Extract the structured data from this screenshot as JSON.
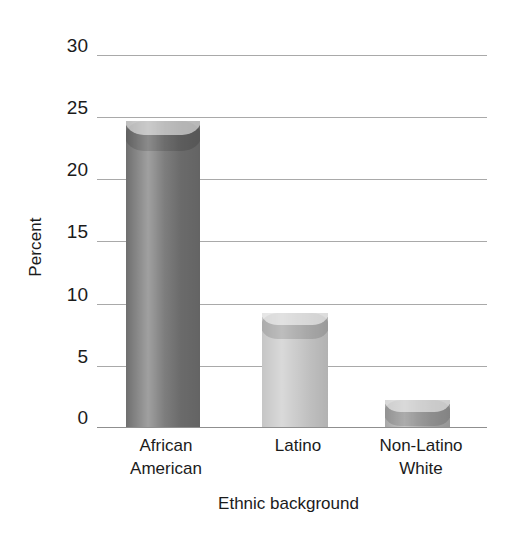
{
  "chart_data": {
    "type": "bar",
    "title": "",
    "subtitle": "",
    "xlabel": "Ethnic background",
    "ylabel": "Percent",
    "categories": [
      "African\nAmerican",
      "Latino",
      "Non-Latino\nWhite"
    ],
    "category_labels_flat": [
      "African American",
      "Latino",
      "Non-Latino White"
    ],
    "values": [
      24.7,
      9.2,
      2.2
    ],
    "ylim": [
      0,
      30
    ],
    "yticks": [
      0,
      5,
      10,
      15,
      20,
      25,
      30
    ],
    "ytick_labels": [
      "0",
      "5",
      "10",
      "15",
      "20",
      "25",
      "30"
    ],
    "grid": "horizontal",
    "legend": "none",
    "bar_style": "3d-cylinder",
    "bar_colors": [
      "#6f6f6f",
      "#c6c6c6",
      "#a8a8a8"
    ],
    "gridline_color": "#a9a9a9",
    "background_color": "#ffffff",
    "text_color": "#1b1b1b"
  },
  "axis": {
    "y_title": "Percent",
    "x_title": "Ethnic background",
    "ticks": [
      {
        "label": "30",
        "value": 30
      },
      {
        "label": "25",
        "value": 25
      },
      {
        "label": "20",
        "value": 20
      },
      {
        "label": "15",
        "value": 15
      },
      {
        "label": "10",
        "value": 10
      },
      {
        "label": "5",
        "value": 5
      },
      {
        "label": "0",
        "value": 0
      }
    ]
  },
  "bars": [
    {
      "label": "African\nAmerican",
      "value": 24.7,
      "color": "#6f6f6f"
    },
    {
      "label": "Latino",
      "value": 9.2,
      "color": "#c6c6c6"
    },
    {
      "label": "Non-Latino\nWhite",
      "value": 2.2,
      "color": "#a8a8a8"
    }
  ]
}
